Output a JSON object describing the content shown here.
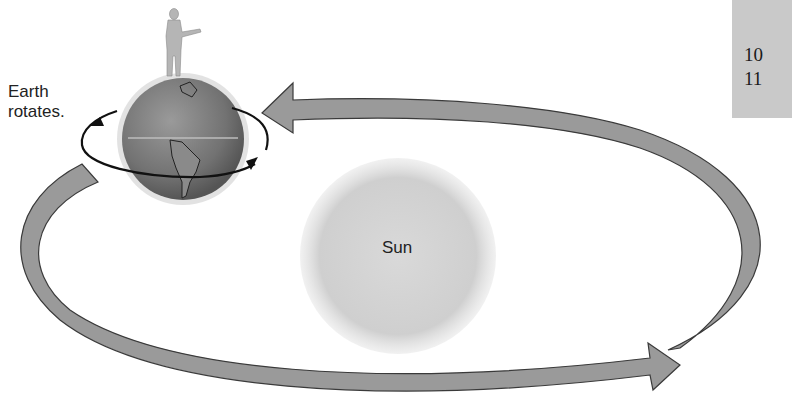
{
  "diagram": {
    "labels": {
      "earth_line1": "Earth",
      "earth_line2": "rotates.",
      "sun": "Sun"
    },
    "side_panel": {
      "lines": [
        "10",
        "11"
      ]
    },
    "colors": {
      "orbit_arrow_fill": "#9a9a9a",
      "orbit_arrow_stroke": "#3a3a3a",
      "sun_fill": "#d2d2d2",
      "earth_fill": "#7f7f7f",
      "rotation_arrow": "#111111",
      "side_panel_bg": "#c9c9c9"
    }
  }
}
